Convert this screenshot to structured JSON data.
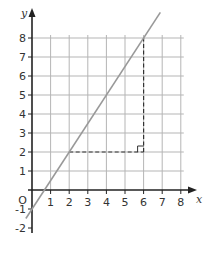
{
  "chart_data": {
    "type": "line",
    "title": "",
    "xlabel": "x",
    "ylabel": "y",
    "origin_label": "O",
    "xlim": [
      0,
      8
    ],
    "ylim": [
      -2,
      8
    ],
    "grid": true,
    "grid_x_range": [
      0,
      8
    ],
    "grid_y_range": [
      0,
      8
    ],
    "x_ticks": [
      1,
      2,
      3,
      4,
      5,
      6,
      7,
      8
    ],
    "x_tick_labels": [
      "1",
      "2",
      "3",
      "4",
      "5",
      "6",
      "7",
      "8"
    ],
    "y_ticks": [
      -2,
      -1,
      1,
      2,
      3,
      4,
      5,
      6,
      7,
      8
    ],
    "y_tick_labels": [
      "-2",
      "-1",
      "1",
      "2",
      "3",
      "4",
      "5",
      "6",
      "7",
      "8"
    ],
    "series": [
      {
        "name": "line",
        "equation": "y = 1.5x - 1",
        "x": [
          -0.33,
          6.9
        ],
        "y": [
          -1.5,
          9.35
        ],
        "color": "#999999"
      }
    ],
    "annotations": [
      {
        "type": "gradient-triangle",
        "from": [
          2,
          2
        ],
        "corner": [
          6,
          2
        ],
        "to": [
          6,
          8
        ],
        "style": "dashed",
        "right_angle_marker": true,
        "color": "#333333"
      }
    ],
    "colors": {
      "grid": "#b5b5b5",
      "axis": "#222222",
      "line": "#999999",
      "dashed": "#333333"
    }
  }
}
